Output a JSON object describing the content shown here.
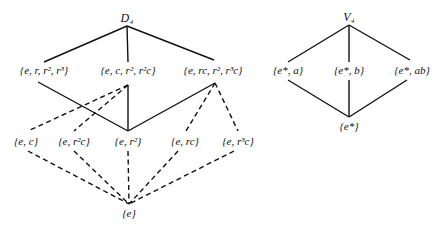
{
  "diagrams": [
    {
      "title": "D₄",
      "nodes": [
        {
          "id": "D4",
          "label": "D₄",
          "x": 127,
          "y": 18,
          "is_title": true
        },
        {
          "id": "rot",
          "label": "{e, r, r², r³}",
          "x": 44,
          "y": 70
        },
        {
          "id": "c_r2c",
          "label": "{e, c, r², r²c}",
          "x": 128,
          "y": 70
        },
        {
          "id": "rc_r3c",
          "label": "{e, rc, r², r³c}",
          "x": 213,
          "y": 70
        },
        {
          "id": "ec",
          "label": "{e, c}",
          "x": 26,
          "y": 141
        },
        {
          "id": "er2c",
          "label": "{e, r²c}",
          "x": 74,
          "y": 141
        },
        {
          "id": "er2",
          "label": "{e, r²}",
          "x": 128,
          "y": 141
        },
        {
          "id": "erc",
          "label": "{e, rc}",
          "x": 185,
          "y": 141
        },
        {
          "id": "er3c",
          "label": "{e, r³c}",
          "x": 238,
          "y": 141
        },
        {
          "id": "e",
          "label": "{e}",
          "x": 129,
          "y": 213
        }
      ],
      "edges": [
        {
          "from": [
            127,
            26
          ],
          "to": [
            44,
            62
          ],
          "style": "solid"
        },
        {
          "from": [
            127,
            26
          ],
          "to": [
            128,
            62
          ],
          "style": "solid"
        },
        {
          "from": [
            127,
            26
          ],
          "to": [
            214,
            60
          ],
          "style": "solid"
        },
        {
          "from": [
            38,
            82
          ],
          "to": [
            128,
            131
          ],
          "style": "solid"
        },
        {
          "from": [
            128,
            85
          ],
          "to": [
            128,
            131
          ],
          "style": "solid"
        },
        {
          "from": [
            215,
            83
          ],
          "to": [
            128,
            131
          ],
          "style": "solid"
        },
        {
          "from": [
            128,
            85
          ],
          "to": [
            28,
            131
          ],
          "style": "dashed"
        },
        {
          "from": [
            128,
            85
          ],
          "to": [
            74,
            131
          ],
          "style": "dashed"
        },
        {
          "from": [
            215,
            83
          ],
          "to": [
            186,
            131
          ],
          "style": "dashed"
        },
        {
          "from": [
            215,
            83
          ],
          "to": [
            238,
            131
          ],
          "style": "dashed"
        },
        {
          "from": [
            28,
            151
          ],
          "to": [
            129,
            204
          ],
          "style": "dashed"
        },
        {
          "from": [
            74,
            151
          ],
          "to": [
            129,
            204
          ],
          "style": "dashed"
        },
        {
          "from": [
            128,
            151
          ],
          "to": [
            129,
            204
          ],
          "style": "dashed"
        },
        {
          "from": [
            178,
            151
          ],
          "to": [
            129,
            204
          ],
          "style": "dashed"
        },
        {
          "from": [
            234,
            151
          ],
          "to": [
            129,
            204
          ],
          "style": "dashed"
        }
      ]
    },
    {
      "title": "V₄",
      "nodes": [
        {
          "id": "V4",
          "label": "V₄",
          "x": 349,
          "y": 17,
          "is_title": true
        },
        {
          "id": "ea",
          "label": "{e*, a}",
          "x": 288,
          "y": 70
        },
        {
          "id": "eb",
          "label": "{e*, b}",
          "x": 349,
          "y": 70
        },
        {
          "id": "eab",
          "label": "{e*, ab}",
          "x": 412,
          "y": 70
        },
        {
          "id": "estar",
          "label": "{e*}",
          "x": 349,
          "y": 126
        }
      ],
      "edges": [
        {
          "from": [
            349,
            25
          ],
          "to": [
            288,
            62
          ],
          "style": "solid"
        },
        {
          "from": [
            349,
            25
          ],
          "to": [
            349,
            62
          ],
          "style": "solid"
        },
        {
          "from": [
            349,
            25
          ],
          "to": [
            410,
            60
          ],
          "style": "solid"
        },
        {
          "from": [
            288,
            80
          ],
          "to": [
            349,
            117
          ],
          "style": "solid"
        },
        {
          "from": [
            349,
            80
          ],
          "to": [
            349,
            117
          ],
          "style": "solid"
        },
        {
          "from": [
            407,
            80
          ],
          "to": [
            349,
            117
          ],
          "style": "solid"
        }
      ]
    }
  ],
  "colors": {
    "line": "#111111",
    "background": "#ffffff"
  }
}
